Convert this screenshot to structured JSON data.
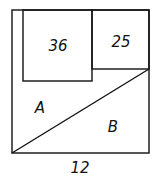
{
  "diagram": {
    "outer_square": {
      "x": 12,
      "y": 10,
      "w": 137,
      "h": 143
    },
    "square_36": {
      "x": 23,
      "y": 10,
      "w": 69,
      "h": 71,
      "label": "36"
    },
    "square_25": {
      "x": 92,
      "y": 10,
      "w": 57,
      "h": 59,
      "label": "25"
    },
    "diagonal": {
      "x1": 12,
      "y1": 153,
      "x2": 149,
      "y2": 69
    },
    "region_a_label": "A",
    "region_b_label": "B",
    "side_length_label": "12",
    "stroke_color": "#111111"
  }
}
